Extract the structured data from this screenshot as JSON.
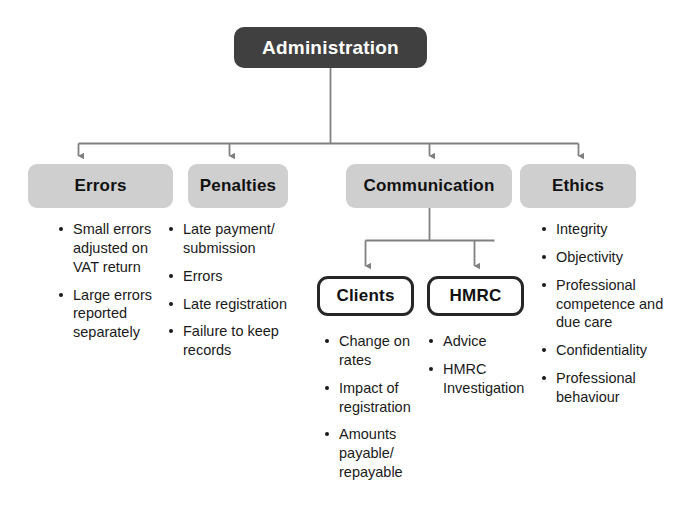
{
  "diagram": {
    "title": "Administration",
    "type": "hierarchy-flowchart",
    "colors": {
      "root_fill": "#404040",
      "root_text": "#ffffff",
      "level2_fill": "#cfcfcf",
      "level2_text": "#111111",
      "level3_fill": "#ffffff",
      "level3_border": "#262626",
      "connector": "#808080",
      "body_text": "#1a1a1a",
      "background": "#ffffff"
    },
    "root": {
      "label": "Administration"
    },
    "level2": [
      {
        "label": "Errors"
      },
      {
        "label": "Penalties"
      },
      {
        "label": "Communication"
      },
      {
        "label": "Ethics"
      }
    ],
    "level3": [
      {
        "label": "Clients"
      },
      {
        "label": "HMRC"
      }
    ],
    "lists": {
      "errors": [
        "Small errors adjusted on VAT return",
        "Large errors reported separately"
      ],
      "penalties": [
        "Late payment/ submission",
        "Errors",
        "Late registration",
        "Failure to keep records"
      ],
      "clients": [
        "Change on rates",
        "Impact of registration",
        "Amounts payable/ repayable"
      ],
      "hmrc": [
        "Advice",
        "HMRC Investigation"
      ],
      "ethics": [
        "Integrity",
        "Objectivity",
        "Professional competence and due care",
        "Confidentiality",
        "Professional behaviour"
      ]
    }
  }
}
